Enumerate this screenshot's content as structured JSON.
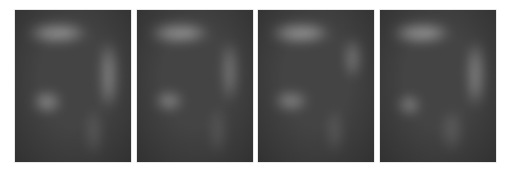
{
  "image": {
    "background": "#ffffff",
    "panel_base_color": "#444444",
    "panels": [
      {
        "left": 15,
        "blobs": [
          {
            "name": "top-bar",
            "x": 12,
            "y": 14,
            "w": 60,
            "h": 18,
            "color": "#9a9a9a",
            "opacity": 0.9
          },
          {
            "name": "right-bar",
            "x": 86,
            "y": 30,
            "w": 16,
            "h": 70,
            "color": "#8c8c8c",
            "opacity": 0.85
          },
          {
            "name": "lower-left-blob",
            "x": 18,
            "y": 82,
            "w": 28,
            "h": 20,
            "color": "#8e8e8e",
            "opacity": 0.85
          },
          {
            "name": "lower-right-streak",
            "x": 72,
            "y": 100,
            "w": 14,
            "h": 46,
            "color": "#6a6a6a",
            "opacity": 0.7
          }
        ]
      },
      {
        "left": 137,
        "blobs": [
          {
            "name": "top-bar",
            "x": 12,
            "y": 14,
            "w": 60,
            "h": 18,
            "color": "#9a9a9a",
            "opacity": 0.9
          },
          {
            "name": "right-bar",
            "x": 86,
            "y": 30,
            "w": 14,
            "h": 62,
            "color": "#868686",
            "opacity": 0.8
          },
          {
            "name": "lower-left-blob",
            "x": 18,
            "y": 82,
            "w": 28,
            "h": 18,
            "color": "#8a8a8a",
            "opacity": 0.85
          },
          {
            "name": "lower-right-streak",
            "x": 74,
            "y": 98,
            "w": 14,
            "h": 48,
            "color": "#666666",
            "opacity": 0.7
          }
        ]
      },
      {
        "left": 258,
        "blobs": [
          {
            "name": "top-bar",
            "x": 12,
            "y": 14,
            "w": 60,
            "h": 18,
            "color": "#9c9c9c",
            "opacity": 0.9
          },
          {
            "name": "right-bar",
            "x": 88,
            "y": 28,
            "w": 14,
            "h": 40,
            "color": "#8a8a8a",
            "opacity": 0.8
          },
          {
            "name": "lower-left-blob",
            "x": 16,
            "y": 82,
            "w": 34,
            "h": 18,
            "color": "#8a8a8a",
            "opacity": 0.85
          },
          {
            "name": "lower-right-streak",
            "x": 70,
            "y": 100,
            "w": 14,
            "h": 44,
            "color": "#686868",
            "opacity": 0.7
          }
        ]
      },
      {
        "left": 380,
        "blobs": [
          {
            "name": "top-bar",
            "x": 12,
            "y": 14,
            "w": 58,
            "h": 18,
            "color": "#9c9c9c",
            "opacity": 0.9
          },
          {
            "name": "right-bar",
            "x": 88,
            "y": 30,
            "w": 16,
            "h": 68,
            "color": "#8e8e8e",
            "opacity": 0.85
          },
          {
            "name": "lower-left-blob",
            "x": 18,
            "y": 86,
            "w": 22,
            "h": 18,
            "color": "#8a8a8a",
            "opacity": 0.85
          },
          {
            "name": "lower-right-streak",
            "x": 62,
            "y": 100,
            "w": 20,
            "h": 42,
            "color": "#666666",
            "opacity": 0.7
          }
        ]
      }
    ]
  }
}
